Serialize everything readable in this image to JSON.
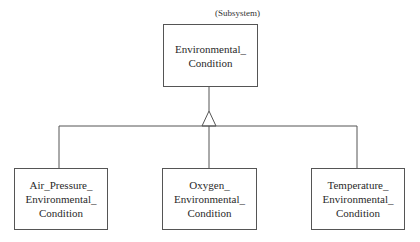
{
  "diagram": {
    "type": "class-generalization",
    "stereotype": "(Subsystem)",
    "parent": {
      "lines": [
        "Environmental_",
        "Condition"
      ]
    },
    "children": [
      {
        "lines": [
          "Air_Pressure_",
          "Environmental_",
          "Condition"
        ]
      },
      {
        "lines": [
          "Oxygen_",
          "Environmental_",
          "Condition"
        ]
      },
      {
        "lines": [
          "Temperature_",
          "Environmental_",
          "Condition"
        ]
      }
    ],
    "relationship": "generalization",
    "colors": {
      "line": "#555555",
      "background": "#ffffff",
      "text": "#2a2a2a"
    }
  }
}
